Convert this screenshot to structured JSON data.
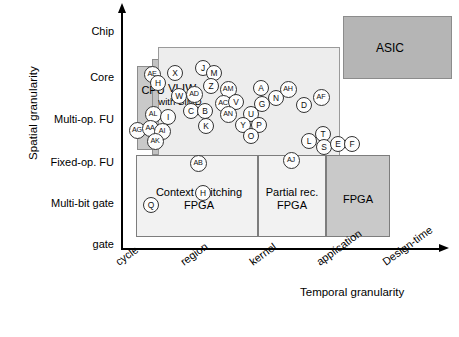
{
  "figure": {
    "y_axis_title": "Spatial granularity",
    "x_axis_title": "Temporal  granularity"
  },
  "chart_data": {
    "type": "scatter",
    "title": "",
    "xlabel": "Temporal  granularity",
    "ylabel": "Spatial granularity",
    "grid": false,
    "legend_position": "none",
    "x_categories": [
      "cycle",
      "region",
      "kernel",
      "application",
      "Design-time"
    ],
    "y_categories": [
      "gate",
      "Multi-bit gate",
      "Fixed-op. FU",
      "Multi-op. FU",
      "Core",
      "Chip"
    ],
    "annotations": [
      {
        "label": "CPU",
        "x": "cycle",
        "y": "Core"
      },
      {
        "label": "VLIW",
        "x": "cycle-region",
        "y": "Core"
      },
      {
        "label": "with SIMD",
        "x": "cycle-region",
        "y": "Multi-op. FU"
      },
      {
        "label": "ASIC",
        "x": "Design-time",
        "y": "Chip"
      },
      {
        "label": "Context switching FPGA",
        "x": "cycle-region",
        "y": "Multi-bit gate"
      },
      {
        "label": "Partial rec. FPGA",
        "x": "kernel",
        "y": "Multi-bit gate"
      },
      {
        "label": "FPGA",
        "x": "application",
        "y": "Multi-bit gate"
      }
    ],
    "regions": [
      {
        "name": "cpu-block",
        "label": "CPU",
        "x": 137,
        "y": 66,
        "w": 45,
        "h": 84,
        "fill": "#c9c9c9",
        "stroke": "#8c8c8c"
      },
      {
        "name": "vliw-block",
        "label": "VLIW",
        "x": 152,
        "y": 59,
        "w": 62,
        "h": 96,
        "fill": "#c2c2c2",
        "stroke": "#8c8c8c"
      },
      {
        "name": "simd-block",
        "label": "with SIMD",
        "x": 158,
        "y": 47,
        "w": 182,
        "h": 121,
        "fill": "#ededed",
        "stroke": "#9a9a9a"
      },
      {
        "name": "asic-block",
        "label": "ASIC",
        "x": 343,
        "y": 16,
        "w": 109,
        "h": 63,
        "fill": "#b5b5b5",
        "stroke": "#8c8c8c"
      },
      {
        "name": "context-switching-fpga-block",
        "label": "Context switching FPGA",
        "x": 136,
        "y": 155,
        "w": 122,
        "h": 82,
        "fill": "#f2f2f2",
        "stroke": "#7d7d7d"
      },
      {
        "name": "partial-rec-fpga-block",
        "label": "Partial rec. FPGA",
        "x": 258,
        "y": 155,
        "w": 68,
        "h": 82,
        "fill": "#f2f2f2",
        "stroke": "#7d7d7d"
      },
      {
        "name": "fpga-block",
        "label": "FPGA",
        "x": 326,
        "y": 155,
        "w": 64,
        "h": 82,
        "fill": "#c9c9c9",
        "stroke": "#7d7d7d"
      }
    ],
    "points": [
      {
        "label": "AE",
        "x": 152,
        "y": 74
      },
      {
        "label": "X",
        "x": 175,
        "y": 73
      },
      {
        "label": "H",
        "x": 158,
        "y": 83
      },
      {
        "label": "J",
        "x": 203,
        "y": 68
      },
      {
        "label": "M",
        "x": 214,
        "y": 73
      },
      {
        "label": "Z",
        "x": 211,
        "y": 86
      },
      {
        "label": "W",
        "x": 179,
        "y": 96
      },
      {
        "label": "AD",
        "x": 194,
        "y": 94
      },
      {
        "label": "AM",
        "x": 228,
        "y": 89
      },
      {
        "label": "AL",
        "x": 153,
        "y": 114
      },
      {
        "label": "I",
        "x": 168,
        "y": 117
      },
      {
        "label": "C",
        "x": 191,
        "y": 111
      },
      {
        "label": "B",
        "x": 205,
        "y": 111
      },
      {
        "label": "K",
        "x": 206,
        "y": 126
      },
      {
        "label": "AC",
        "x": 223,
        "y": 103
      },
      {
        "label": "V",
        "x": 236,
        "y": 102
      },
      {
        "label": "AN",
        "x": 228,
        "y": 114
      },
      {
        "label": "U",
        "x": 251,
        "y": 114
      },
      {
        "label": "G",
        "x": 262,
        "y": 104
      },
      {
        "label": "Y",
        "x": 243,
        "y": 125
      },
      {
        "label": "P",
        "x": 259,
        "y": 125
      },
      {
        "label": "O",
        "x": 251,
        "y": 136
      },
      {
        "label": "AG",
        "x": 137,
        "y": 130
      },
      {
        "label": "AA",
        "x": 150,
        "y": 128
      },
      {
        "label": "AI",
        "x": 162,
        "y": 131
      },
      {
        "label": "AK",
        "x": 155,
        "y": 141
      },
      {
        "label": "A",
        "x": 261,
        "y": 88
      },
      {
        "label": "N",
        "x": 276,
        "y": 98
      },
      {
        "label": "AH",
        "x": 288,
        "y": 89
      },
      {
        "label": "AF",
        "x": 321,
        "y": 97
      },
      {
        "label": "D",
        "x": 304,
        "y": 105
      },
      {
        "label": "T",
        "x": 323,
        "y": 134
      },
      {
        "label": "L",
        "x": 309,
        "y": 141
      },
      {
        "label": "S",
        "x": 324,
        "y": 147
      },
      {
        "label": "E",
        "x": 338,
        "y": 144
      },
      {
        "label": "F",
        "x": 352,
        "y": 144
      },
      {
        "label": "AB",
        "x": 198,
        "y": 163
      },
      {
        "label": "AJ",
        "x": 291,
        "y": 160
      },
      {
        "label": "Q",
        "x": 151,
        "y": 205
      },
      {
        "label": "H",
        "x": 203,
        "y": 193
      }
    ]
  }
}
